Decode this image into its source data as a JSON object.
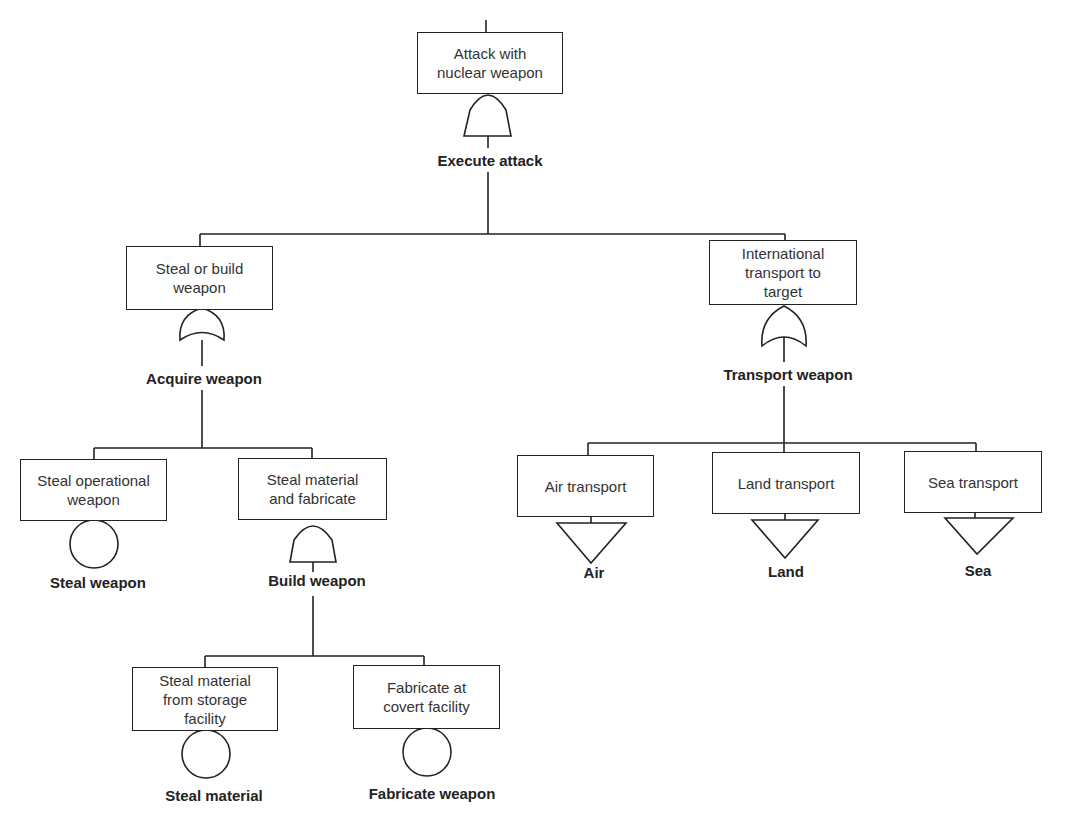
{
  "diagram": {
    "type": "fault-tree",
    "line_color": "#222222",
    "nodes": {
      "root": {
        "label": "Attack with\nnuclear weapon",
        "gate": "AND",
        "gate_label": "Execute attack"
      },
      "acquire": {
        "label": "Steal or build\nweapon",
        "gate": "OR",
        "gate_label": "Acquire weapon"
      },
      "transport": {
        "label": "International\ntransport to\ntarget",
        "gate": "OR",
        "gate_label": "Transport weapon"
      },
      "steal_op": {
        "label": "Steal operational\nweapon",
        "gate": "basic-event",
        "gate_label": "Steal weapon"
      },
      "steal_fab": {
        "label": "Steal material\nand fabricate",
        "gate": "AND",
        "gate_label": "Build weapon"
      },
      "steal_mat": {
        "label": "Steal material\nfrom storage\nfacility",
        "gate": "basic-event",
        "gate_label": "Steal material"
      },
      "fab_covert": {
        "label": "Fabricate at\ncovert facility",
        "gate": "basic-event",
        "gate_label": "Fabricate weapon"
      },
      "air": {
        "label": "Air transport",
        "gate": "undeveloped-transfer",
        "gate_label": "Air"
      },
      "land": {
        "label": "Land transport",
        "gate": "undeveloped-transfer",
        "gate_label": "Land"
      },
      "sea": {
        "label": "Sea transport",
        "gate": "undeveloped-transfer",
        "gate_label": "Sea"
      }
    }
  }
}
